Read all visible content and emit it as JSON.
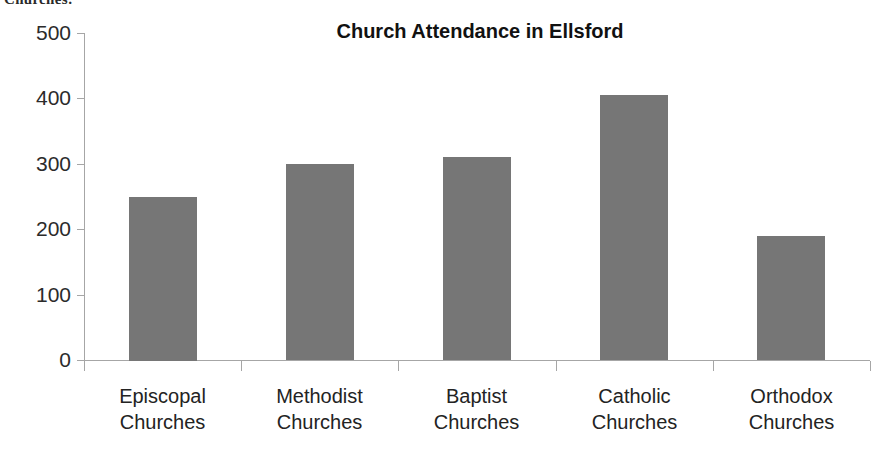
{
  "caption_fragment": "Churches:",
  "chart_data": {
    "type": "bar",
    "title": "Church Attendance in Ellsford",
    "xlabel": "",
    "ylabel": "",
    "ylim": [
      0,
      500
    ],
    "ytick_values": [
      500,
      400,
      300,
      200,
      100,
      0
    ],
    "ytick_labels": [
      "500",
      "400",
      "300",
      "200",
      "100",
      "0"
    ],
    "grid": false,
    "legend": false,
    "legend_position": "none",
    "bar_color": "#767676",
    "axis_color": "#a6a6a6",
    "categories": [
      "Episcopal Churches",
      "Methodist Churches",
      "Baptist Churches",
      "Catholic Churches",
      "Orthodox Churches"
    ],
    "category_lines": [
      [
        "Episcopal",
        "Churches"
      ],
      [
        "Methodist",
        "Churches"
      ],
      [
        "Baptist",
        "Churches"
      ],
      [
        "Catholic",
        "Churches"
      ],
      [
        "Orthodox",
        "Churches"
      ]
    ],
    "values": [
      250,
      300,
      310,
      405,
      190
    ],
    "series": [
      {
        "name": "Attendance",
        "values": [
          250,
          300,
          310,
          405,
          190
        ]
      }
    ]
  }
}
